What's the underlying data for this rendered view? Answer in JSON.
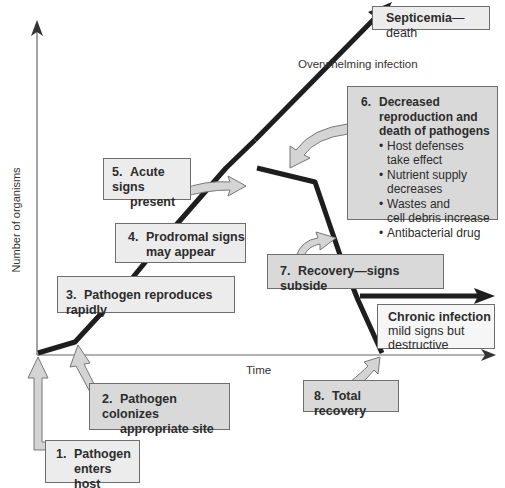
{
  "axes": {
    "y_label": "Number of organisms",
    "x_label": "Time"
  },
  "annotations": {
    "overwhelming": "Overwhelming infection",
    "septicemia": {
      "bold": "Septicemia",
      "rest": "—death"
    },
    "chronic": {
      "title": "Chronic infection",
      "line1": "mild signs but",
      "line2": "destructive"
    }
  },
  "stages": [
    {
      "num": "1.",
      "lines": [
        "Pathogen",
        "enters host"
      ]
    },
    {
      "num": "2.",
      "lines": [
        "Pathogen colonizes",
        "appropriate site"
      ]
    },
    {
      "num": "3.",
      "lines": [
        "Pathogen reproduces rapidly"
      ]
    },
    {
      "num": "4.",
      "lines": [
        "Prodromal signs",
        "may appear"
      ]
    },
    {
      "num": "5.",
      "lines": [
        "Acute signs",
        "present"
      ]
    },
    {
      "num": "6.",
      "lines": [
        "Decreased",
        "reproduction and",
        "death of pathogens"
      ],
      "bullets": [
        "Host defenses take effect",
        "Nutrient supply decreases",
        "Wastes and cell debris increase",
        "Antibacterial drug"
      ],
      "bullet_lines": [
        [
          "Host defenses",
          "take effect"
        ],
        [
          "Nutrient supply",
          "decreases"
        ],
        [
          "Wastes and",
          "cell debris increase"
        ],
        [
          "Antibacterial drug"
        ]
      ]
    },
    {
      "num": "7.",
      "lines": [
        "Recovery—signs subside"
      ]
    },
    {
      "num": "8.",
      "lines": [
        "Total recovery"
      ]
    }
  ],
  "colors": {
    "box_fill": "#d9d9d9",
    "line": "#1e1e1e",
    "arrow_fill": "#cfcfcf"
  }
}
